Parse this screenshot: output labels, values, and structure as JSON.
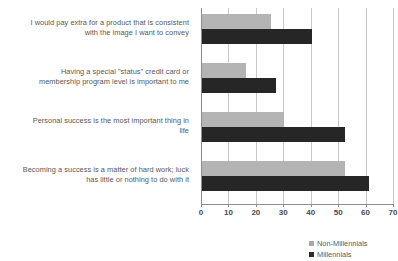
{
  "chart_data": {
    "type": "bar",
    "orientation": "horizontal",
    "title": "",
    "xlabel": "",
    "ylabel": "",
    "xlim": [
      0,
      70
    ],
    "xticks": [
      0,
      10,
      20,
      30,
      40,
      50,
      60,
      70
    ],
    "grid": "vertical",
    "legend_position": "bottom-right",
    "categories": [
      "I would pay extra for a product that is consistent with the image I want to convey",
      "Having a special \"status\" credit card or membership program level is important to me",
      "Personal success is the most important thing in life",
      "Becoming a success is a matter of hard work; luck has little or nothing to do with it"
    ],
    "series": [
      {
        "name": "Non-Millennials",
        "color": "#b4b4b4",
        "values": [
          25,
          16,
          30,
          52
        ]
      },
      {
        "name": "Millennials",
        "color": "#262626",
        "values": [
          40,
          27,
          52,
          61
        ]
      }
    ]
  },
  "category_lines": [
    [
      "I would pay extra for a product that is consistent",
      "with the image I want to convey"
    ],
    [
      "Having a special \"status\" credit card or",
      "membership program level is important to me"
    ],
    [
      "Personal success is the most important thing in",
      "life"
    ],
    [
      "Becoming a success is a matter of hard work; luck",
      "has little or nothing to do with it"
    ]
  ],
  "axis": {
    "tick_labels": [
      "0",
      "10",
      "20",
      "30",
      "40",
      "50",
      "60",
      "70"
    ]
  },
  "legend": {
    "items": [
      {
        "label": "Non-Millennials",
        "color": "#a8a8a8"
      },
      {
        "label": "Millennials",
        "color": "#2b2b2b"
      }
    ]
  }
}
